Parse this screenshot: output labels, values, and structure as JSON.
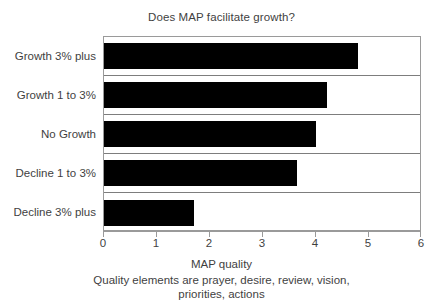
{
  "chart_data": {
    "type": "bar",
    "orientation": "horizontal",
    "title": "Does MAP facilitate growth?",
    "xlabel": "MAP quality",
    "xlabel_caption_line1": "Quality elements are prayer, desire, review, vision,",
    "xlabel_caption_line2": "priorities, actions",
    "ylabel": "",
    "categories": [
      "Growth 3% plus",
      "Growth 1 to 3%",
      "No Growth",
      "Decline 1 to 3%",
      "Decline 3% plus"
    ],
    "values": [
      4.8,
      4.2,
      4.0,
      3.65,
      1.7
    ],
    "xlim": [
      0,
      6
    ],
    "xticks": [
      0,
      1,
      2,
      3,
      4,
      5,
      6
    ],
    "xtick_labels": [
      "0",
      "1",
      "2",
      "3",
      "4",
      "5",
      "6"
    ],
    "grid": true,
    "legend": false,
    "bar_color": "#000000",
    "text_color": "#3f3f3f",
    "axis_color": "#9a9a9a",
    "gridline_color": "#7d7d7d",
    "background_color": "#ffffff"
  }
}
